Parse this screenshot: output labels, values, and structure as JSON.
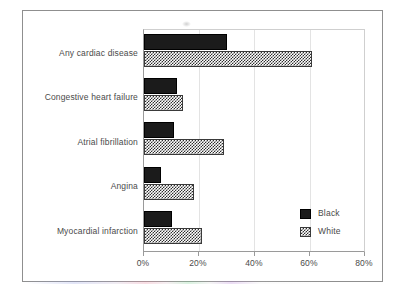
{
  "chart_data": {
    "type": "bar",
    "orientation": "horizontal",
    "title": "",
    "subtitle": "",
    "xlabel": "",
    "ylabel": "",
    "xlim": [
      0,
      80
    ],
    "xunit": "%",
    "xticks": [
      0,
      20,
      40,
      60,
      80
    ],
    "xtick_labels": [
      "0%",
      "20%",
      "40%",
      "60%",
      "80%"
    ],
    "grid": "vertical",
    "legend_position": "bottom-right",
    "categories": [
      "Any cardiac disease",
      "Congestive heart failure",
      "Atrial fibrillation",
      "Angina",
      "Myocardial infarction"
    ],
    "series": [
      {
        "name": "Black",
        "pattern": "solid",
        "color": "#1b1b1b",
        "values": [
          30,
          12,
          11,
          6,
          10
        ]
      },
      {
        "name": "White",
        "pattern": "checkered",
        "color": "#ffffff",
        "values": [
          61,
          14,
          29,
          18,
          21
        ]
      }
    ]
  },
  "legend": {
    "items": [
      {
        "label": "Black",
        "swatch": "solid-black-swatch"
      },
      {
        "label": "White",
        "swatch": "checkered-white-swatch"
      }
    ]
  },
  "colors": {
    "black_series": "#1b1b1b",
    "white_series": "#ffffff",
    "axis": "#9a9a9a",
    "grid": "#e3e3e3",
    "text": "#4a4a4a",
    "frame": "#8f8f8f"
  }
}
